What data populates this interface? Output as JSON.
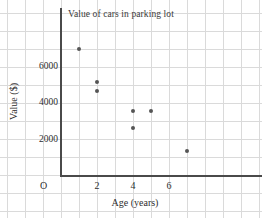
{
  "chart_data": {
    "type": "scatter",
    "title": "Value of cars in parking lot",
    "xlabel": "Age (years)",
    "ylabel": "Value ($)",
    "origin_label": "O",
    "xlim": [
      0,
      11
    ],
    "ylim": [
      0,
      9000
    ],
    "xticks": [
      2,
      4,
      6
    ],
    "xtick_labels": [
      "2",
      "4",
      "6"
    ],
    "yticks": [
      2000,
      4000,
      6000
    ],
    "ytick_labels": [
      "2000",
      "4000",
      "6000"
    ],
    "grid": true,
    "legend": "none",
    "point_color": "#555555",
    "grid_color": "#dadada",
    "axis_color": "#4a4a4a",
    "points": [
      {
        "x": 1,
        "y": 6900
      },
      {
        "x": 2,
        "y": 5100
      },
      {
        "x": 2,
        "y": 4600
      },
      {
        "x": 4,
        "y": 3500
      },
      {
        "x": 4,
        "y": 2600
      },
      {
        "x": 5,
        "y": 3500
      },
      {
        "x": 7,
        "y": 1300
      }
    ]
  }
}
